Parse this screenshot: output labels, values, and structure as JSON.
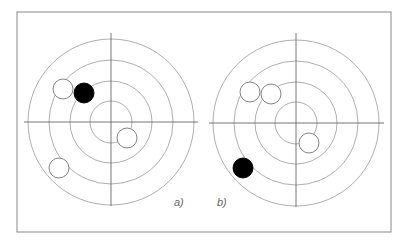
{
  "figure": {
    "frame": {
      "x": 17,
      "y": 12,
      "width": 374,
      "height": 220,
      "stroke": "#8a8a8a"
    },
    "colors": {
      "ring": "#9a9a9a",
      "axis": "#555555",
      "track": "#555555",
      "open_marker_stroke": "#777777",
      "filled_marker": "#000000",
      "label": "#666666"
    },
    "ring_radii": [
      83,
      62,
      41,
      21
    ],
    "marker_radius": 10,
    "panels": [
      {
        "id": "a",
        "label": "a)",
        "label_pos": {
          "x": 174,
          "y": 206
        },
        "center": {
          "x": 111,
          "y": 122
        },
        "axis_h": {
          "x1": 24,
          "x2": 198
        },
        "axis_v": {
          "y1": 33,
          "y2": 206
        },
        "markers": [
          {
            "type": "open",
            "x": 63,
            "y": 89
          },
          {
            "type": "filled",
            "x": 84,
            "y": 93
          },
          {
            "type": "open",
            "x": 127,
            "y": 138
          },
          {
            "type": "open",
            "x": 59,
            "y": 168
          }
        ]
      },
      {
        "id": "b",
        "label": "b)",
        "label_pos": {
          "x": 217,
          "y": 206
        },
        "center": {
          "x": 296,
          "y": 123
        },
        "axis_h": {
          "x1": 209,
          "x2": 384
        },
        "axis_v": {
          "y1": 33,
          "y2": 207
        },
        "markers": [
          {
            "type": "open",
            "x": 250,
            "y": 92
          },
          {
            "type": "open",
            "x": 271,
            "y": 94
          },
          {
            "type": "open",
            "x": 309,
            "y": 143
          },
          {
            "type": "filled",
            "x": 243,
            "y": 168
          }
        ]
      }
    ]
  }
}
